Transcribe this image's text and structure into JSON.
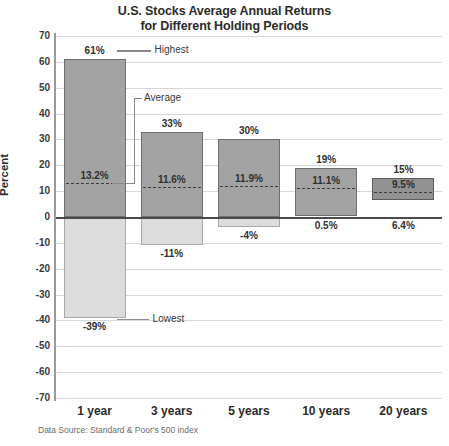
{
  "title": {
    "line1": "U.S. Stocks Average Annual Returns",
    "line2": "for Different Holding Periods"
  },
  "axis": {
    "ylabel": "Percent",
    "yticks": [
      "70",
      "60",
      "50",
      "40",
      "30",
      "20",
      "10",
      "0",
      "-10",
      "-20",
      "-30",
      "-40",
      "-50",
      "-60",
      "-70"
    ]
  },
  "annotations": {
    "highest": "Highest",
    "average": "Average",
    "lowest": "Lowest"
  },
  "source": "Data Source: Standard & Poor's 500 index",
  "colors": {
    "bar_positive": "#a3a3a3",
    "bar_positive_dark": "#929292",
    "bar_negative": "#dcdcdc",
    "bar_border": "#6f6f6f",
    "gridline": "#d7d7d7",
    "zero_line": "#4a4a4a",
    "text": "#2b2b2b"
  },
  "bars": [
    {
      "category": "1 year",
      "high_label": "61%",
      "low_label": "-39%",
      "avg_label": "13.2%",
      "shade": "light"
    },
    {
      "category": "3 years",
      "high_label": "33%",
      "low_label": "-11%",
      "avg_label": "11.6%",
      "shade": "light"
    },
    {
      "category": "5 years",
      "high_label": "30%",
      "low_label": "-4%",
      "avg_label": "11.9%",
      "shade": "light"
    },
    {
      "category": "10 years",
      "high_label": "19%",
      "low_label": "0.5%",
      "avg_label": "11.1%",
      "shade": "light"
    },
    {
      "category": "20 years",
      "high_label": "15%",
      "low_label": "6.4%",
      "avg_label": "9.5%",
      "shade": "dark"
    }
  ],
  "chart_data": {
    "type": "bar",
    "title": "U.S. Stocks Average Annual Returns for Different Holding Periods",
    "subtitle": "",
    "xlabel": "",
    "ylabel": "Percent",
    "ylim": [
      -70,
      70
    ],
    "ytick_step": 10,
    "grid": true,
    "legend": false,
    "note": "Floating range bars: each bar spans from the lowest to the highest average annual return for that holding period; dashed line marks the average.",
    "categories": [
      "1 year",
      "3 years",
      "5 years",
      "10 years",
      "20 years"
    ],
    "series": [
      {
        "name": "Highest",
        "values": [
          61,
          33,
          30,
          19,
          15
        ]
      },
      {
        "name": "Lowest",
        "values": [
          -39,
          -11,
          -4,
          0.5,
          6.4
        ]
      },
      {
        "name": "Average",
        "values": [
          13.2,
          11.6,
          11.9,
          11.1,
          9.5
        ]
      }
    ],
    "annotations": [
      {
        "text": "Highest",
        "points_to": "1 year high (61%)"
      },
      {
        "text": "Average",
        "points_to": "1 year average (13.2%)"
      },
      {
        "text": "Lowest",
        "points_to": "1 year low (-39%)"
      }
    ],
    "source": "Data Source: Standard & Poor's 500 index"
  }
}
